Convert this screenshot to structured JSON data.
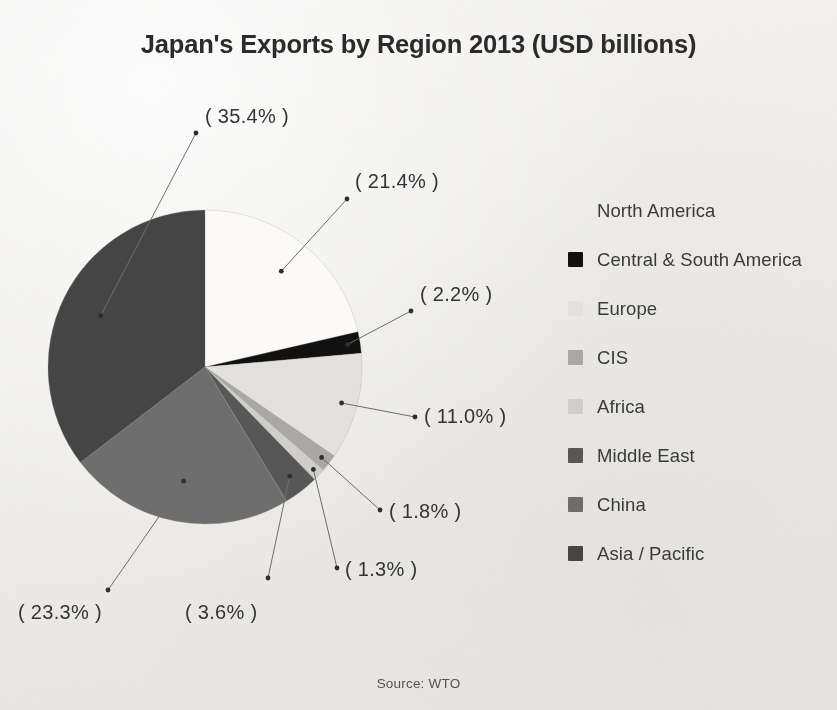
{
  "title": "Japan's Exports by Region 2013 (USD billions)",
  "source": "Source: WTO",
  "legend": {
    "items": [
      {
        "label": "North America",
        "color": "#fbfaf8"
      },
      {
        "label": "Central & South America",
        "color": "#111111"
      },
      {
        "label": "Europe",
        "color": "#e2e1de"
      },
      {
        "label": "CIS",
        "color": "#a9a8a4"
      },
      {
        "label": "Africa",
        "color": "#cfcecb"
      },
      {
        "label": "Middle East",
        "color": "#575757"
      },
      {
        "label": "China",
        "color": "#6e6e6e"
      },
      {
        "label": "Asia / Pacific",
        "color": "#454545"
      }
    ]
  },
  "callouts": [
    {
      "text": "( 35.4% )",
      "left": 205,
      "top": 105
    },
    {
      "text": "( 21.4% )",
      "left": 355,
      "top": 170
    },
    {
      "text": "( 2.2% )",
      "left": 420,
      "top": 283
    },
    {
      "text": "( 11.0% )",
      "left": 424,
      "top": 405
    },
    {
      "text": "( 1.8% )",
      "left": 389,
      "top": 500
    },
    {
      "text": "( 1.3% )",
      "left": 345,
      "top": 558
    },
    {
      "text": "( 23.3% )",
      "left": 18,
      "top": 601
    },
    {
      "text": "( 3.6% )",
      "left": 185,
      "top": 601
    }
  ],
  "chart_data": {
    "type": "pie",
    "title": "Japan's Exports by Region 2013 (USD billions)",
    "subtitle": "",
    "source": "Source: WTO",
    "unit": "percent of total exports",
    "start_angle_deg": 0,
    "direction": "clockwise",
    "legend_position": "right",
    "grid": false,
    "labels": [
      "North America",
      "Central & South America",
      "Europe",
      "CIS",
      "Africa",
      "Middle East",
      "China",
      "Asia / Pacific"
    ],
    "values": [
      21.4,
      2.2,
      11.0,
      1.8,
      1.3,
      3.6,
      23.3,
      35.4
    ],
    "value_labels": [
      "( 21.4% )",
      "( 2.2% )",
      "( 11.0% )",
      "( 1.8% )",
      "( 1.3% )",
      "( 3.6% )",
      "( 23.3% )",
      "( 35.4% )"
    ],
    "colors": [
      "#fbfaf8",
      "#111111",
      "#e2e1de",
      "#a9a8a4",
      "#cfcecb",
      "#575757",
      "#6e6e6e",
      "#454545"
    ],
    "total_percent": 100.0,
    "geometry": {
      "center_x": 205,
      "center_y": 367,
      "radius": 157
    }
  }
}
